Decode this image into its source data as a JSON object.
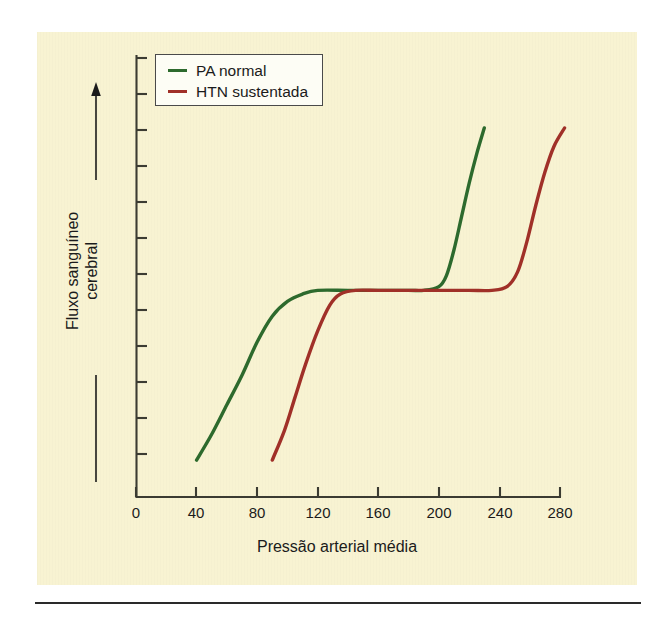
{
  "figure": {
    "background_color": "#f8f3d2",
    "page_background": "#ffffff",
    "rule_color": "#2a2a2a"
  },
  "chart_data": {
    "type": "line",
    "title": "",
    "subtitle": "",
    "xlabel": "Pressão arterial média",
    "ylabel": "Fluxo sanguíneo cerebral",
    "ylabel_lines": [
      "Fluxo sanguíneo",
      "cerebral"
    ],
    "xlim": [
      0,
      300
    ],
    "ylim": [
      0,
      100
    ],
    "xticks": [
      0,
      40,
      80,
      120,
      160,
      200,
      240,
      280
    ],
    "xtick_labels": [
      "0",
      "40",
      "80",
      "120",
      "160",
      "200",
      "240",
      "280"
    ],
    "yticks": [],
    "ytick_labels": [],
    "y_axis_unlabeled_tick_count": 12,
    "grid": false,
    "legend_position": "top-left",
    "annotations": [
      {
        "name": "y-direction-arrow",
        "description": "upward arrow beside y-axis indicating increasing blood flow"
      }
    ],
    "series": [
      {
        "name": "PA normal",
        "color": "#2d6a2d",
        "x": [
          40,
          50,
          60,
          70,
          80,
          90,
          100,
          110,
          120,
          140,
          160,
          180,
          190,
          200,
          205,
          210,
          215,
          220,
          225,
          230
        ],
        "y": [
          10,
          17,
          25,
          33,
          42,
          49,
          53,
          55,
          56,
          56,
          56,
          56,
          56,
          57,
          60,
          67,
          76,
          85,
          93,
          100
        ]
      },
      {
        "name": "HTN sustentada",
        "color": "#a03028",
        "x": [
          90,
          98,
          105,
          112,
          120,
          128,
          135,
          145,
          160,
          180,
          200,
          220,
          235,
          245,
          252,
          258,
          264,
          270,
          276,
          283
        ],
        "y": [
          10,
          18,
          27,
          36,
          45,
          52,
          55,
          56,
          56,
          56,
          56,
          56,
          56,
          57,
          61,
          69,
          79,
          88,
          95,
          100
        ]
      }
    ]
  },
  "legend": {
    "items": [
      {
        "label": "PA normal",
        "color": "#2d6a2d"
      },
      {
        "label": "HTN sustentada",
        "color": "#a03028"
      }
    ]
  },
  "axes": {
    "x_tick_labels": [
      "0",
      "40",
      "80",
      "120",
      "160",
      "200",
      "240",
      "280"
    ],
    "x_title": "Pressão arterial média",
    "y_title_line1": "Fluxo sanguíneo",
    "y_title_line2": "cerebral"
  }
}
